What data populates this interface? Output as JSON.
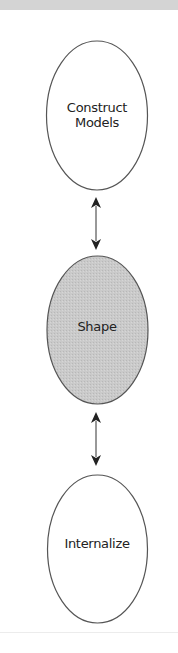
{
  "diagram": {
    "type": "vertical-flow",
    "nodes": [
      {
        "id": "construct-models",
        "label_lines": [
          "Construct",
          "Models"
        ],
        "fill": "#ffffff",
        "stroke": "#555555"
      },
      {
        "id": "shape",
        "label_lines": [
          "Shape"
        ],
        "fill": "#c8c8c8",
        "stroke": "#555555"
      },
      {
        "id": "internalize",
        "label_lines": [
          "Internalize"
        ],
        "fill": "#ffffff",
        "stroke": "#555555"
      }
    ],
    "edges": [
      {
        "from": "construct-models",
        "to": "shape",
        "direction": "bidirectional"
      },
      {
        "from": "shape",
        "to": "internalize",
        "direction": "bidirectional"
      }
    ],
    "colors": {
      "top_band": "#d4d4d4",
      "arrow": "#222222"
    }
  }
}
